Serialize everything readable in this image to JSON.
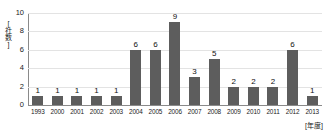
{
  "chart_data": {
    "type": "bar",
    "title": "",
    "subtitle": "",
    "xlabel": "[年度]",
    "ylabel": "[社数]",
    "categories": [
      "1993",
      "2000",
      "2001",
      "2002",
      "2003",
      "2004",
      "2005",
      "2006",
      "2007",
      "2008",
      "2009",
      "2010",
      "2011",
      "2012",
      "2013"
    ],
    "values": [
      1,
      1,
      1,
      1,
      1,
      6,
      6,
      9,
      3,
      5,
      2,
      2,
      2,
      6,
      1
    ],
    "ylim": [
      0,
      10
    ],
    "yticks": [
      0,
      2,
      4,
      6,
      8,
      10
    ],
    "grid": true,
    "legend": null,
    "legend_position": "none",
    "show_value_labels": true,
    "colors": {
      "bar": "#5d5d5d",
      "gridline": "#e3e3e3",
      "axis": "#8a8a8a",
      "text": "#1a1a1a",
      "background": "#ffffff"
    }
  }
}
